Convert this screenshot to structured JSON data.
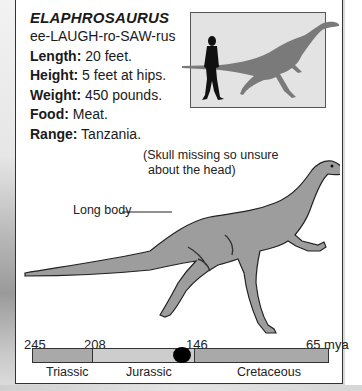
{
  "dinosaur": {
    "name": "ELAPHROSAURUS",
    "pronunciation": "ee-LAUGH-ro-SAW-rus",
    "facts": [
      {
        "label": "Length:",
        "value": " 20 feet."
      },
      {
        "label": "Height:",
        "value": " 5 feet at hips."
      },
      {
        "label": "Weight:",
        "value": " 450 pounds."
      },
      {
        "label": "Food:",
        "value": " Meat."
      },
      {
        "label": "Range:",
        "value": " Tanzania."
      }
    ]
  },
  "illustration": {
    "note_line1": "(Skull missing so unsure",
    "note_line2": "about the head)",
    "callout": "Long body"
  },
  "scale_figure": {
    "description": "human silhouette vs dinosaur silhouette",
    "colors": {
      "box": "#e3e3e3",
      "dino": "#7a7a7a",
      "human": "#111111"
    }
  },
  "timeline": {
    "ticks": [
      {
        "value": "245",
        "x": 24
      },
      {
        "value": "208",
        "x": 84
      },
      {
        "value": "146",
        "x": 186
      },
      {
        "value": "65 mya",
        "x": 306
      }
    ],
    "periods": [
      {
        "name": "Triassic",
        "x": 46
      },
      {
        "name": "Jurassic",
        "x": 126
      },
      {
        "name": "Cretaceous",
        "x": 237
      }
    ],
    "colors": {
      "triassic": "#a9a9a9",
      "jurassic": "#cdcdcd",
      "cretaceous": "#a9a9a9",
      "marker": "#000000"
    },
    "marker_position_mya": "~150"
  }
}
